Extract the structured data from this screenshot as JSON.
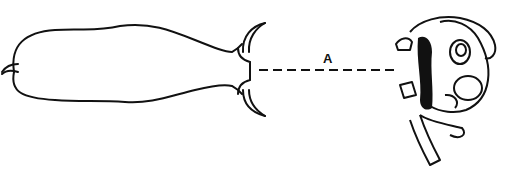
{
  "diagram": {
    "label_a": "A",
    "colors": {
      "stroke": "#111111",
      "background": "#ffffff"
    },
    "elements": [
      {
        "name": "elongated-body-outline",
        "position": "left"
      },
      {
        "name": "dashed-distance-line",
        "label": "A"
      },
      {
        "name": "complex-figure",
        "position": "right"
      }
    ]
  }
}
